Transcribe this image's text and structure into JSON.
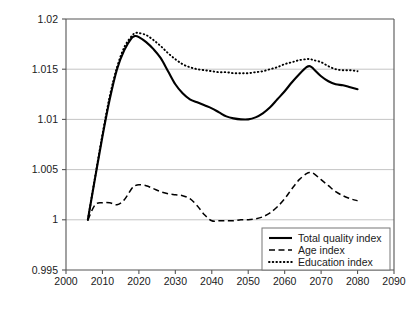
{
  "chart_data": {
    "type": "line",
    "title": "",
    "subtitle": "",
    "xlabel": "",
    "ylabel": "",
    "xlim": [
      2000,
      2090
    ],
    "ylim": [
      0.995,
      1.02
    ],
    "grid": true,
    "grid_axis": "y",
    "legend_position": "bottom-right",
    "x_ticks": [
      2000,
      2010,
      2020,
      2030,
      2040,
      2050,
      2060,
      2070,
      2080,
      2090
    ],
    "x_tick_labels": [
      "2000",
      "2010",
      "2020",
      "2030",
      "2040",
      "2050",
      "2060",
      "2070",
      "2080",
      "2090"
    ],
    "y_ticks": [
      0.995,
      1.0,
      1.005,
      1.01,
      1.015,
      1.02
    ],
    "y_tick_labels": [
      "0.995",
      "1",
      "1.005",
      "1.01",
      "1.015",
      "1.02"
    ],
    "x": [
      2006,
      2008,
      2010,
      2012,
      2014,
      2016,
      2018,
      2019,
      2020,
      2022,
      2024,
      2026,
      2028,
      2030,
      2032,
      2034,
      2036,
      2038,
      2040,
      2042,
      2044,
      2046,
      2048,
      2050,
      2052,
      2054,
      2056,
      2058,
      2060,
      2062,
      2064,
      2066,
      2067,
      2068,
      2070,
      2072,
      2074,
      2076,
      2078,
      2080
    ],
    "series": [
      {
        "name": "Total quality index",
        "style": "solid",
        "color": "#000000",
        "values": [
          1.0,
          1.0042,
          1.0083,
          1.012,
          1.015,
          1.0169,
          1.0181,
          1.0183,
          1.0182,
          1.0177,
          1.017,
          1.0161,
          1.0148,
          1.0135,
          1.0126,
          1.012,
          1.0117,
          1.0114,
          1.0111,
          1.0107,
          1.0103,
          1.0101,
          1.01,
          1.01,
          1.0102,
          1.0106,
          1.0112,
          1.012,
          1.0128,
          1.0137,
          1.0145,
          1.0152,
          1.0153,
          1.015,
          1.0143,
          1.0138,
          1.0135,
          1.0134,
          1.0132,
          1.013
        ]
      },
      {
        "name": "Age index",
        "style": "dashed",
        "color": "#000000",
        "values": [
          1.0,
          1.0015,
          1.0017,
          1.0017,
          1.0015,
          1.002,
          1.0031,
          1.0034,
          1.0035,
          1.0034,
          1.0031,
          1.0028,
          1.0026,
          1.0025,
          1.0024,
          1.0021,
          1.0014,
          1.0005,
          0.9999,
          0.9999,
          0.9999,
          0.9999,
          1.0,
          1.0,
          1.0001,
          1.0003,
          1.0007,
          1.0013,
          1.0021,
          1.0031,
          1.004,
          1.0046,
          1.0047,
          1.0046,
          1.004,
          1.0034,
          1.0028,
          1.0024,
          1.0021,
          1.0019
        ]
      },
      {
        "name": "Education index",
        "style": "dotted",
        "color": "#000000",
        "values": [
          1.0,
          1.0043,
          1.0085,
          1.0123,
          1.0152,
          1.0172,
          1.0183,
          1.0186,
          1.0186,
          1.0184,
          1.0179,
          1.0173,
          1.0166,
          1.016,
          1.0155,
          1.0152,
          1.015,
          1.0149,
          1.0148,
          1.0147,
          1.0147,
          1.0146,
          1.0146,
          1.0146,
          1.0147,
          1.0148,
          1.015,
          1.0152,
          1.0155,
          1.0157,
          1.0159,
          1.016,
          1.016,
          1.0159,
          1.0157,
          1.0153,
          1.015,
          1.0149,
          1.0149,
          1.0148
        ]
      }
    ]
  },
  "legend": {
    "entries": [
      {
        "label": "Total quality index",
        "style": "solid"
      },
      {
        "label": "Age index",
        "style": "dashed"
      },
      {
        "label": "Education index",
        "style": "dotted"
      }
    ]
  }
}
